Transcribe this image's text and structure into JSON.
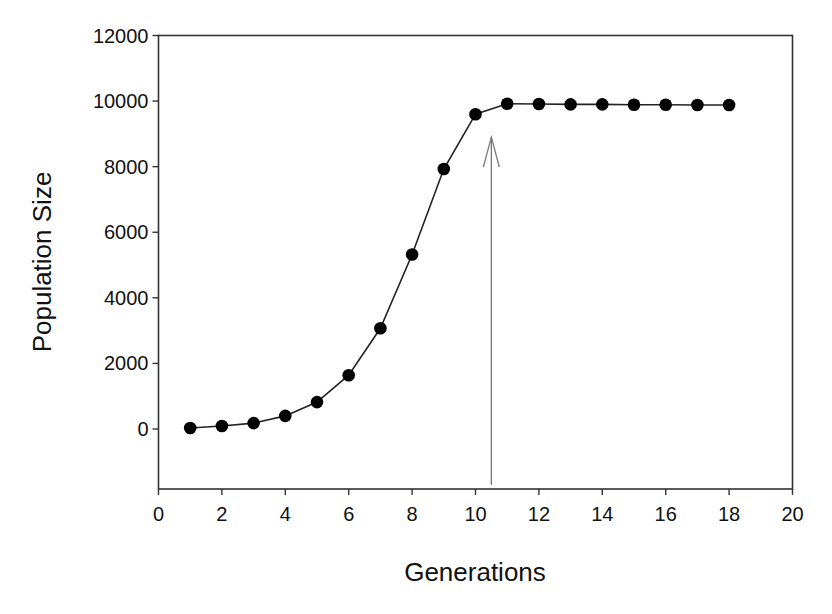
{
  "chart_data": {
    "type": "line",
    "title": "",
    "xlabel": "Generations",
    "ylabel": "Population Size",
    "xlim": [
      0,
      20
    ],
    "ylim": [
      -1830,
      12000
    ],
    "x_ticks": [
      0,
      2,
      4,
      6,
      8,
      10,
      12,
      14,
      16,
      18,
      20
    ],
    "y_ticks": [
      0,
      2000,
      4000,
      6000,
      8000,
      10000,
      12000
    ],
    "grid": false,
    "legend": null,
    "markers": "filled-circle",
    "series": [
      {
        "name": "Population",
        "x": [
          1,
          2,
          3,
          4,
          5,
          6,
          7,
          8,
          9,
          10,
          11,
          12,
          13,
          14,
          15,
          16,
          17,
          18
        ],
        "values": [
          30,
          90,
          180,
          400,
          820,
          1640,
          3070,
          5320,
          7930,
          9600,
          9920,
          9910,
          9900,
          9900,
          9890,
          9890,
          9880,
          9880
        ]
      }
    ],
    "annotations": [
      {
        "type": "arrow",
        "x": 10.5,
        "y_from": -1700,
        "y_to": 8900,
        "direction": "up",
        "text": ""
      }
    ]
  },
  "colors": {
    "line": "#222222",
    "marker": "#000000",
    "axis": "#333333",
    "arrow": "#777777"
  }
}
